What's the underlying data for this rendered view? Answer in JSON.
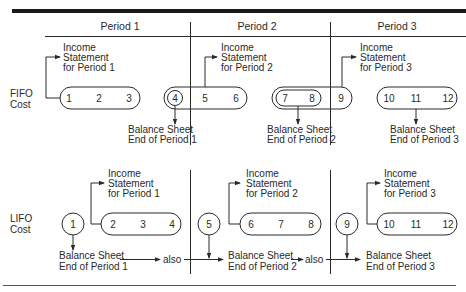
{
  "periods": [
    {
      "label": "Period 1"
    },
    {
      "label": "Period 2"
    },
    {
      "label": "Period 3"
    }
  ],
  "fifo": {
    "row_label_line1": "FIFO",
    "row_label_line2": "Cost",
    "units": [
      "1",
      "2",
      "3",
      "4",
      "5",
      "6",
      "7",
      "8",
      "9",
      "10",
      "11",
      "12"
    ],
    "income_statements": [
      {
        "line1": "Income",
        "line2": "Statement",
        "line3": "for Period 1"
      },
      {
        "line1": "Income",
        "line2": "Statement",
        "line3": "for Period 2"
      },
      {
        "line1": "Income",
        "line2": "Statement",
        "line3": "for Period 3"
      }
    ],
    "balance_sheets": [
      {
        "line1": "Balance Sheet",
        "line2": "End of Period 1"
      },
      {
        "line1": "Balance Sheet",
        "line2": "End of Period 2"
      },
      {
        "line1": "Balance Sheet",
        "line2": "End of Period 3"
      }
    ]
  },
  "lifo": {
    "row_label_line1": "LIFO",
    "row_label_line2": "Cost",
    "units": [
      "1",
      "2",
      "3",
      "4",
      "5",
      "6",
      "7",
      "8",
      "9",
      "10",
      "11",
      "12"
    ],
    "income_statements": [
      {
        "line1": "Income",
        "line2": "Statement",
        "line3": "for Period 1"
      },
      {
        "line1": "Income",
        "line2": "Statement",
        "line3": "for Period 2"
      },
      {
        "line1": "Income",
        "line2": "Statement",
        "line3": "for Period 3"
      }
    ],
    "balance_sheets": [
      {
        "line1": "Balance Sheet",
        "line2": "End of Period 1"
      },
      {
        "line1": "Balance Sheet",
        "line2": "End of Period 2"
      },
      {
        "line1": "Balance Sheet",
        "line2": "End of Period 3"
      }
    ],
    "connector_label": "also"
  },
  "colors": {
    "ink": "#2a2a2a",
    "background": "#ffffff"
  }
}
